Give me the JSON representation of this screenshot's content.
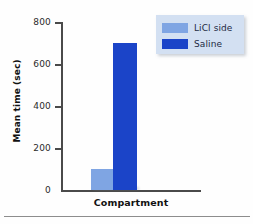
{
  "chart_data": {
    "type": "bar",
    "title": "",
    "xlabel": "Compartment",
    "ylabel": "Mean time (sec)",
    "categories": [
      "Compartment"
    ],
    "series": [
      {
        "name": "LiCl side",
        "values": [
          100
        ],
        "color": "#7fa5e3"
      },
      {
        "name": "Saline",
        "values": [
          700
        ],
        "color": "#1b44c8"
      }
    ],
    "ylim": [
      0,
      800
    ],
    "yticks": [
      0,
      200,
      400,
      600,
      800
    ],
    "ytick_labels": [
      "0",
      "200",
      "400",
      "600",
      "800"
    ],
    "grid": false,
    "legend_position": "top-right"
  },
  "axes": {
    "y_title": "Mean time (sec)",
    "x_title": "Compartment",
    "ticks": [
      {
        "label": "800",
        "value": 800
      },
      {
        "label": "600",
        "value": 600
      },
      {
        "label": "400",
        "value": 400
      },
      {
        "label": "200",
        "value": 200
      },
      {
        "label": "0",
        "value": 0
      }
    ]
  },
  "legend": {
    "items": [
      {
        "label": "LiCl side",
        "color": "#7fa5e3"
      },
      {
        "label": "Saline",
        "color": "#1b44c8"
      }
    ],
    "background": "#d3e0f2"
  },
  "colors": {
    "licl_side": "#7fa5e3",
    "saline": "#1b44c8",
    "axis": "#4a4a4a",
    "text": "#111111"
  }
}
